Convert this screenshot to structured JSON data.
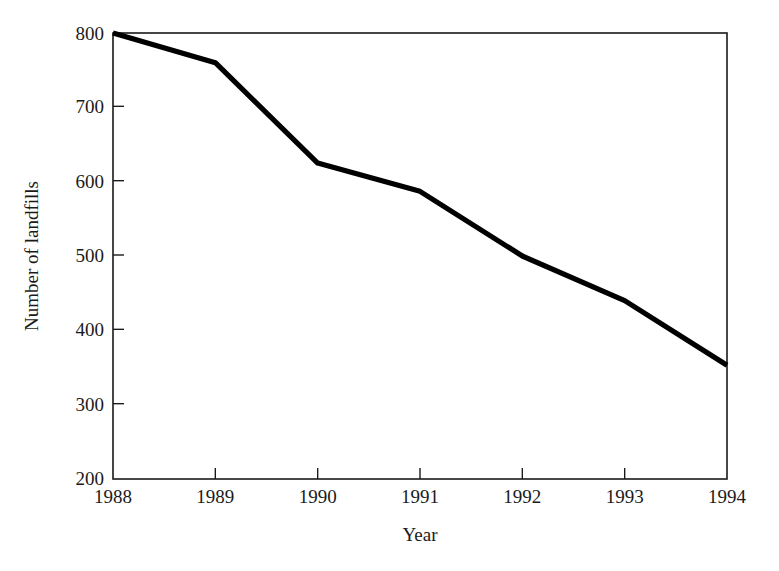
{
  "chart_data": {
    "type": "line",
    "title": "",
    "xlabel": "Year",
    "ylabel": "Number of landfills",
    "categories": [
      "1988",
      "1989",
      "1990",
      "1991",
      "1992",
      "1993",
      "1994"
    ],
    "x": [
      1988,
      1989,
      1990,
      1991,
      1992,
      1993,
      1994
    ],
    "values": [
      800,
      760,
      625,
      587,
      500,
      440,
      353
    ],
    "series": [
      {
        "name": "Number of landfills",
        "values": [
          800,
          760,
          625,
          587,
          500,
          440,
          353
        ]
      }
    ],
    "xlim": [
      1988,
      1994
    ],
    "ylim": [
      200,
      800
    ],
    "ytick_labels": [
      "200",
      "300",
      "400",
      "500",
      "600",
      "700",
      "800"
    ],
    "ytick_values": [
      200,
      300,
      400,
      500,
      600,
      700,
      800
    ],
    "xtick_labels": [
      "1988",
      "1989",
      "1990",
      "1991",
      "1992",
      "1993",
      "1994"
    ],
    "grid": false,
    "legend": false,
    "line_color": "#000000",
    "frame_color": "#1a1a1a",
    "background_color": "#ffffff"
  }
}
